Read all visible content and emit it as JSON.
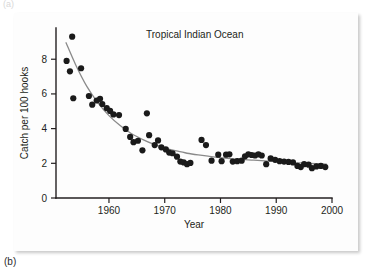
{
  "figure": {
    "panel_label": "(b)",
    "panel_label_above": "(a)"
  },
  "chart_data": {
    "type": "scatter",
    "title": "Tropical Indian Ocean",
    "xlabel": "Year",
    "ylabel": "Catch per 100 hooks",
    "xlim": [
      1950.5,
      2000
    ],
    "ylim": [
      0,
      9.8
    ],
    "xticks": [
      1960,
      1970,
      1980,
      1990,
      2000
    ],
    "xtick_labels": [
      "1960",
      "1970",
      "1980",
      "1990",
      "2000"
    ],
    "yticks": [
      0,
      2,
      4,
      6,
      8
    ],
    "ytick_labels": [
      "0",
      "2",
      "4",
      "6",
      "8"
    ],
    "grid": false,
    "legend": "none",
    "marker": "filled-circle",
    "marker_color": "#1a1a1a",
    "fit_curve_color": "#8a8a8a",
    "fit_curve_label": "exponential decline fit",
    "points": [
      {
        "x": 1952.4,
        "y": 7.9
      },
      {
        "x": 1953.0,
        "y": 7.3
      },
      {
        "x": 1953.4,
        "y": 9.3
      },
      {
        "x": 1953.6,
        "y": 5.75
      },
      {
        "x": 1955.0,
        "y": 7.48
      },
      {
        "x": 1956.4,
        "y": 5.88
      },
      {
        "x": 1957.0,
        "y": 5.38
      },
      {
        "x": 1957.8,
        "y": 5.62
      },
      {
        "x": 1958.4,
        "y": 5.72
      },
      {
        "x": 1958.8,
        "y": 5.42
      },
      {
        "x": 1959.6,
        "y": 5.18
      },
      {
        "x": 1960.2,
        "y": 5.02
      },
      {
        "x": 1960.8,
        "y": 4.82
      },
      {
        "x": 1961.8,
        "y": 4.78
      },
      {
        "x": 1963.0,
        "y": 3.98
      },
      {
        "x": 1963.8,
        "y": 3.52
      },
      {
        "x": 1964.4,
        "y": 3.22
      },
      {
        "x": 1965.2,
        "y": 3.3
      },
      {
        "x": 1966.0,
        "y": 2.75
      },
      {
        "x": 1966.8,
        "y": 4.88
      },
      {
        "x": 1967.2,
        "y": 3.62
      },
      {
        "x": 1968.2,
        "y": 3.05
      },
      {
        "x": 1968.8,
        "y": 3.32
      },
      {
        "x": 1969.4,
        "y": 2.92
      },
      {
        "x": 1970.2,
        "y": 2.8
      },
      {
        "x": 1970.8,
        "y": 2.62
      },
      {
        "x": 1971.4,
        "y": 2.58
      },
      {
        "x": 1972.2,
        "y": 2.38
      },
      {
        "x": 1972.8,
        "y": 2.1
      },
      {
        "x": 1973.4,
        "y": 2.05
      },
      {
        "x": 1974.0,
        "y": 1.95
      },
      {
        "x": 1974.6,
        "y": 2.02
      },
      {
        "x": 1976.6,
        "y": 3.35
      },
      {
        "x": 1977.4,
        "y": 3.05
      },
      {
        "x": 1978.4,
        "y": 2.15
      },
      {
        "x": 1979.6,
        "y": 2.5
      },
      {
        "x": 1980.2,
        "y": 2.12
      },
      {
        "x": 1981.0,
        "y": 2.5
      },
      {
        "x": 1981.6,
        "y": 2.52
      },
      {
        "x": 1982.2,
        "y": 2.1
      },
      {
        "x": 1983.0,
        "y": 2.12
      },
      {
        "x": 1983.8,
        "y": 2.15
      },
      {
        "x": 1984.4,
        "y": 2.4
      },
      {
        "x": 1985.0,
        "y": 2.52
      },
      {
        "x": 1985.6,
        "y": 2.48
      },
      {
        "x": 1986.2,
        "y": 2.45
      },
      {
        "x": 1986.8,
        "y": 2.52
      },
      {
        "x": 1987.4,
        "y": 2.45
      },
      {
        "x": 1988.2,
        "y": 1.95
      },
      {
        "x": 1989.0,
        "y": 2.28
      },
      {
        "x": 1989.8,
        "y": 2.2
      },
      {
        "x": 1990.6,
        "y": 2.12
      },
      {
        "x": 1991.4,
        "y": 2.1
      },
      {
        "x": 1992.2,
        "y": 2.08
      },
      {
        "x": 1993.0,
        "y": 2.05
      },
      {
        "x": 1993.8,
        "y": 1.85
      },
      {
        "x": 1994.4,
        "y": 1.78
      },
      {
        "x": 1995.0,
        "y": 1.95
      },
      {
        "x": 1995.8,
        "y": 1.92
      },
      {
        "x": 1996.4,
        "y": 1.72
      },
      {
        "x": 1997.2,
        "y": 1.82
      },
      {
        "x": 1998.0,
        "y": 1.85
      },
      {
        "x": 1998.8,
        "y": 1.78
      }
    ],
    "fit_curve_points": [
      {
        "x": 1952.3,
        "y": 8.95
      },
      {
        "x": 1954.0,
        "y": 7.7
      },
      {
        "x": 1956.0,
        "y": 6.45
      },
      {
        "x": 1958.0,
        "y": 5.5
      },
      {
        "x": 1960.0,
        "y": 4.75
      },
      {
        "x": 1962.0,
        "y": 4.18
      },
      {
        "x": 1964.0,
        "y": 3.72
      },
      {
        "x": 1966.0,
        "y": 3.38
      },
      {
        "x": 1968.0,
        "y": 3.1
      },
      {
        "x": 1970.0,
        "y": 2.88
      },
      {
        "x": 1972.0,
        "y": 2.72
      },
      {
        "x": 1974.0,
        "y": 2.58
      },
      {
        "x": 1976.0,
        "y": 2.48
      },
      {
        "x": 1978.0,
        "y": 2.4
      },
      {
        "x": 1980.0,
        "y": 2.33
      },
      {
        "x": 1983.0,
        "y": 2.24
      },
      {
        "x": 1986.0,
        "y": 2.18
      },
      {
        "x": 1990.0,
        "y": 2.1
      },
      {
        "x": 1994.0,
        "y": 2.02
      },
      {
        "x": 1999.0,
        "y": 1.95
      }
    ]
  }
}
